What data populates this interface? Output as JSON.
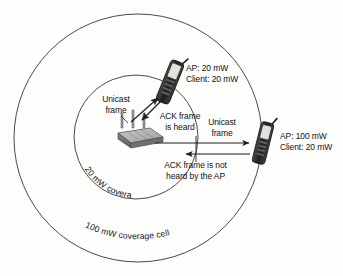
{
  "figure": {
    "background_color": "#fdfdfc",
    "line_color": "#3a3a3a"
  },
  "cells": {
    "outer": {
      "label": "100 mW coverage cell",
      "center_x": 138,
      "center_y": 138,
      "radius": 124,
      "power_mw": 100
    },
    "inner": {
      "label": "20 mW coverage cell",
      "center_x": 136,
      "center_y": 137,
      "radius": 62,
      "power_mw": 20
    }
  },
  "devices": {
    "access_point": {
      "name": "Access point",
      "icon": "wireless-router-icon",
      "x": 136,
      "y": 137
    },
    "near_client": {
      "name": "Near client phone",
      "icon": "mobile-phone-icon",
      "x": 170,
      "y": 82,
      "settings": {
        "ap_power": "AP: 20 mW",
        "client_power": "Client: 20 mW"
      }
    },
    "far_client": {
      "name": "Far client phone",
      "icon": "mobile-phone-icon",
      "x": 263,
      "y": 143,
      "settings": {
        "ap_power": "AP: 100 mW",
        "client_power": "Client: 20 mW"
      }
    }
  },
  "annotations": {
    "unicast_near": {
      "line1": "Unicast",
      "line2": "frame"
    },
    "ack_heard": {
      "line1": "ACK frame",
      "line2": "is heard"
    },
    "unicast_far": {
      "line1": "Unicast",
      "line2": "frame"
    },
    "ack_not_heard": {
      "line1": "ACK frame is not",
      "line2": "heard by the AP"
    }
  }
}
